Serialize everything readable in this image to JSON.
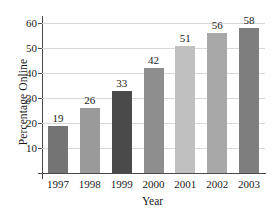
{
  "chart_data": {
    "type": "bar",
    "title": "",
    "xlabel": "Year",
    "ylabel": "Percentage Online",
    "categories": [
      "1997",
      "1998",
      "1999",
      "2000",
      "2001",
      "2002",
      "2003"
    ],
    "values": [
      19,
      26,
      33,
      42,
      51,
      56,
      58
    ],
    "value_labels": [
      "19",
      "26",
      "33",
      "42",
      "51",
      "56",
      "58"
    ],
    "bar_colors": [
      "#747474",
      "#9a9a9a",
      "#4a4a4a",
      "#8e8e8e",
      "#c0c0c0",
      "#a8a8a8",
      "#7e7e7e"
    ],
    "ylim": [
      0,
      62
    ],
    "yticks": [
      10,
      20,
      30,
      40,
      50,
      60
    ],
    "ytick_labels": [
      "10",
      "20",
      "30",
      "40",
      "50",
      "60"
    ],
    "grid": true,
    "grid_color": "#d8d8d8",
    "axis_color": "#4a4a4a",
    "legend": null,
    "legend_position": "none"
  }
}
